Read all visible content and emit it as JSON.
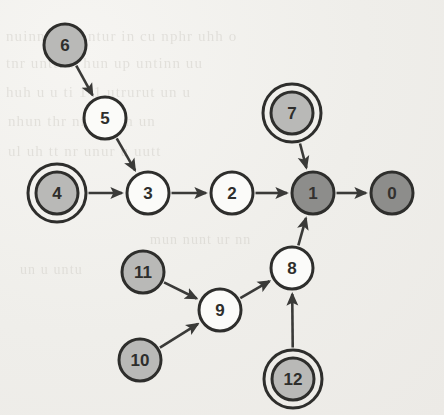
{
  "figure": {
    "type": "directed-graph",
    "title": "",
    "background_color": "#efeeea",
    "node_radius": 21,
    "double_ring_radius": 29,
    "edge_color": "#3a3a38",
    "stroke_color": "#2e2e2c",
    "fills": {
      "white": "#fbfbf9",
      "light_gray": "#b9b9b7",
      "dark_gray": "#8d8d8b"
    },
    "ghost_text_color": "#b9b5ad"
  },
  "graph_data": {
    "type": "diagram",
    "directed": true,
    "node_count": 13,
    "edge_count": 12,
    "nodes": [
      {
        "id": "0",
        "label": "0",
        "x": 392,
        "y": 193,
        "fill": "dark_gray",
        "double_ring": false,
        "text_color": "#33312f"
      },
      {
        "id": "1",
        "label": "1",
        "x": 313,
        "y": 193,
        "fill": "dark_gray",
        "double_ring": false,
        "text_color": "#33312f"
      },
      {
        "id": "2",
        "label": "2",
        "x": 232,
        "y": 193,
        "fill": "white",
        "double_ring": false,
        "text_color": "#2e2e2c"
      },
      {
        "id": "3",
        "label": "3",
        "x": 148,
        "y": 193,
        "fill": "white",
        "double_ring": false,
        "text_color": "#2e2e2c"
      },
      {
        "id": "4",
        "label": "4",
        "x": 57,
        "y": 193,
        "fill": "light_gray",
        "double_ring": true,
        "text_color": "#2e2e2c"
      },
      {
        "id": "5",
        "label": "5",
        "x": 105,
        "y": 118,
        "fill": "white",
        "double_ring": false,
        "text_color": "#2e2e2c"
      },
      {
        "id": "6",
        "label": "6",
        "x": 65,
        "y": 45,
        "fill": "light_gray",
        "double_ring": false,
        "text_color": "#2e2e2c"
      },
      {
        "id": "7",
        "label": "7",
        "x": 292,
        "y": 113,
        "fill": "light_gray",
        "double_ring": true,
        "text_color": "#2e2e2c"
      },
      {
        "id": "8",
        "label": "8",
        "x": 292,
        "y": 268,
        "fill": "white",
        "double_ring": false,
        "text_color": "#2e2e2c"
      },
      {
        "id": "9",
        "label": "9",
        "x": 220,
        "y": 310,
        "fill": "white",
        "double_ring": false,
        "text_color": "#2e2e2c"
      },
      {
        "id": "10",
        "label": "10",
        "x": 140,
        "y": 360,
        "fill": "light_gray",
        "double_ring": false,
        "text_color": "#2e2e2c"
      },
      {
        "id": "11",
        "label": "11",
        "x": 143,
        "y": 272,
        "fill": "light_gray",
        "double_ring": false,
        "text_color": "#2e2e2c"
      },
      {
        "id": "12",
        "label": "12",
        "x": 293,
        "y": 379,
        "fill": "light_gray",
        "double_ring": true,
        "text_color": "#2e2e2c"
      }
    ],
    "edges": [
      {
        "from": "6",
        "to": "5",
        "label": ""
      },
      {
        "from": "5",
        "to": "3",
        "label": ""
      },
      {
        "from": "4",
        "to": "3",
        "label": ""
      },
      {
        "from": "3",
        "to": "2",
        "label": ""
      },
      {
        "from": "2",
        "to": "1",
        "label": ""
      },
      {
        "from": "7",
        "to": "1",
        "label": ""
      },
      {
        "from": "1",
        "to": "0",
        "label": ""
      },
      {
        "from": "8",
        "to": "1",
        "label": ""
      },
      {
        "from": "9",
        "to": "8",
        "label": ""
      },
      {
        "from": "11",
        "to": "9",
        "label": ""
      },
      {
        "from": "10",
        "to": "9",
        "label": ""
      },
      {
        "from": "12",
        "to": "8",
        "label": ""
      }
    ]
  },
  "ghost_text": {
    "note": "faint bleed-through text from the reverse side of the scanned page",
    "lines": [
      {
        "text": "nuinn  tu  ul  ntur  in  cu  nphr  uhh  o",
        "x": 6,
        "y": 28,
        "size": 15
      },
      {
        "text": "tnr  unttirn  hun  up  untinn  uu",
        "x": 6,
        "y": 55,
        "size": 15
      },
      {
        "text": "huh  u  u  ti  1-1  utrurut  un  u",
        "x": 6,
        "y": 84,
        "size": 15
      },
      {
        "text": "nhun  thr  nnt  unun  un",
        "x": 8,
        "y": 113,
        "size": 15
      },
      {
        "text": "ul  uh  tt  nr  unur  u  uutt",
        "x": 8,
        "y": 143,
        "size": 15
      },
      {
        "text": "mun  nunt  ur  nn",
        "x": 150,
        "y": 232,
        "size": 14
      },
      {
        "text": "un  u  untu",
        "x": 20,
        "y": 262,
        "size": 14
      }
    ]
  }
}
